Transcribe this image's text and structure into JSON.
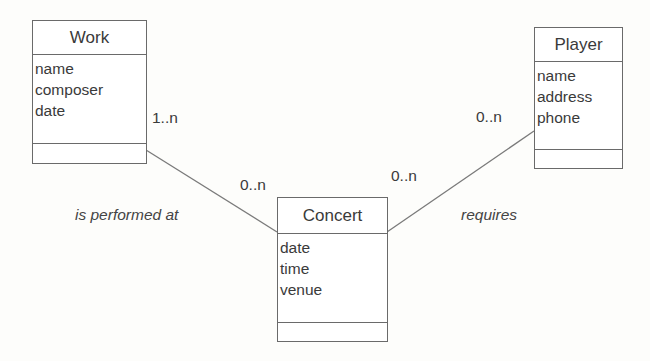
{
  "classes": {
    "work": {
      "name": "Work",
      "attributes": [
        "name",
        "composer",
        "date"
      ]
    },
    "player": {
      "name": "Player",
      "attributes": [
        "name",
        "address",
        "phone"
      ]
    },
    "concert": {
      "name": "Concert",
      "attributes": [
        "date",
        "time",
        "venue"
      ]
    }
  },
  "associations": {
    "work_concert": {
      "label": "is performed at",
      "work_multiplicity": "1..n",
      "concert_multiplicity": "0..n"
    },
    "concert_player": {
      "label": "requires",
      "concert_multiplicity": "0..n",
      "player_multiplicity": "0..n"
    }
  },
  "colors": {
    "line": "#7a7a7a",
    "border": "#6a6a6a",
    "text": "#3a3a3a"
  }
}
